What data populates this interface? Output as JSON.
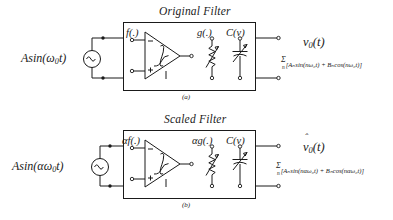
{
  "figure": {
    "caption_a": "(a)",
    "caption_b": "(b)"
  },
  "panel_a": {
    "title": "Original Filter",
    "source_label_pre": "Asin(",
    "source_label_omega": "ω",
    "source_label_sub": "0",
    "source_label_post": "t)",
    "source_icon": "ac-source-icon",
    "blocks": [
      {
        "name": "nonlinearity-f",
        "label": "f(.)"
      },
      {
        "name": "variable-conductance-g",
        "label": "g(.)"
      },
      {
        "name": "variable-capacitor-C",
        "label": "C(v)"
      }
    ],
    "output_label_v": "v",
    "output_label_sub": "0",
    "output_label_t": "(t)",
    "series_sigma": "Σ",
    "series_index": "n",
    "series_body": "[A",
    "series_full": "[Aₙsin(nω₀t) + Bₙcos(nω₀t)]"
  },
  "panel_b": {
    "title": "Scaled Filter",
    "source_label_pre": "Asin(",
    "source_label_alpha": "α",
    "source_label_omega": "ω",
    "source_label_sub": "0",
    "source_label_post": "t)",
    "source_icon": "ac-source-icon",
    "blocks": [
      {
        "name": "nonlinearity-alpha-f",
        "label": "αf(.)"
      },
      {
        "name": "variable-conductance-alpha-g",
        "label": "αg(.)"
      },
      {
        "name": "variable-capacitor-C",
        "label": "C(v)"
      }
    ],
    "output_label_v": "v",
    "output_label_hat": "̂",
    "output_label_sub": "0",
    "output_label_t": "(t)",
    "series_sigma": "Σ",
    "series_index": "n",
    "series_full": "[Aₙsin(nαω₀t) + Bₙcos(nαω₀t)]"
  },
  "colors": {
    "ink": "#1a1a1a",
    "paper": "#ffffff"
  }
}
